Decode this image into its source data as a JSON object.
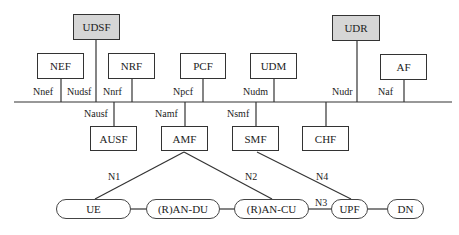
{
  "diagram": {
    "type": "5G service-based architecture",
    "top_functions": [
      {
        "id": "udsf",
        "label": "UDSF",
        "shaded": true,
        "interface": "Nudsf"
      },
      {
        "id": "nef",
        "label": "NEF",
        "shaded": false,
        "interface": "Nnef"
      },
      {
        "id": "nrf",
        "label": "NRF",
        "shaded": false,
        "interface": "Nnrf"
      },
      {
        "id": "pcf",
        "label": "PCF",
        "shaded": false,
        "interface": "Npcf"
      },
      {
        "id": "udm",
        "label": "UDM",
        "shaded": false,
        "interface": "Nudm"
      },
      {
        "id": "udr",
        "label": "UDR",
        "shaded": true,
        "interface": "Nudr"
      },
      {
        "id": "af",
        "label": "AF",
        "shaded": false,
        "interface": "Naf"
      }
    ],
    "bottom_functions": [
      {
        "id": "ausf",
        "label": "AUSF",
        "interface": "Nausf"
      },
      {
        "id": "amf",
        "label": "AMF",
        "interface": "Namf"
      },
      {
        "id": "smf",
        "label": "SMF",
        "interface": "Nsmf"
      },
      {
        "id": "chf",
        "label": "CHF",
        "interface": ""
      }
    ],
    "access_nodes": [
      {
        "id": "ue",
        "label": "UE"
      },
      {
        "id": "ran_du",
        "label": "(R)AN-DU"
      },
      {
        "id": "ran_cu",
        "label": "(R)AN-CU"
      },
      {
        "id": "upf",
        "label": "UPF"
      },
      {
        "id": "dn",
        "label": "DN"
      }
    ],
    "reference_points": {
      "n1": "N1",
      "n2": "N2",
      "n3": "N3",
      "n4": "N4"
    },
    "edges": [
      {
        "from": "AMF",
        "to": "UE",
        "label": "N1"
      },
      {
        "from": "AMF",
        "to": "(R)AN-CU",
        "label": "N2"
      },
      {
        "from": "SMF",
        "to": "UPF",
        "label": "N4"
      },
      {
        "from": "(R)AN-CU",
        "to": "UPF",
        "label": "N3"
      },
      {
        "from": "UE",
        "to": "(R)AN-DU",
        "label": ""
      },
      {
        "from": "(R)AN-DU",
        "to": "(R)AN-CU",
        "label": ""
      },
      {
        "from": "UPF",
        "to": "DN",
        "label": ""
      }
    ],
    "colors": {
      "line": "#333333",
      "shaded_fill": "#d6d6d6",
      "box_fill": "#ffffff"
    }
  }
}
